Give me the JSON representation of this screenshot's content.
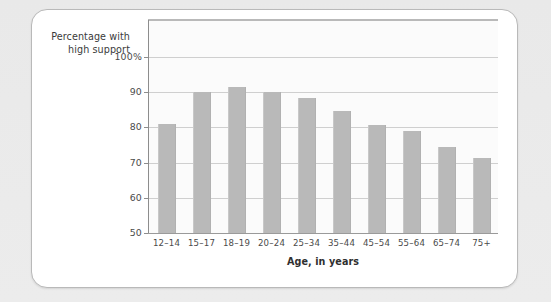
{
  "figure": {
    "card_bg": "#ffffff",
    "page_bg": "#eaeaea",
    "bar_color": "#b9b9b9",
    "grid_color": "#cfcfcf",
    "axis_color": "#8d8d8d"
  },
  "labels": {
    "y_axis_title_line1": "Percentage with",
    "y_axis_title_line2": "high support",
    "x_axis_title": "Age, in years"
  },
  "chart_data": {
    "type": "bar",
    "title": "",
    "subtitle": "",
    "xlabel": "Age, in years",
    "ylabel": "Percentage with high support",
    "categories": [
      "12–14",
      "15–17",
      "18–19",
      "20–24",
      "25–34",
      "35–44",
      "45–54",
      "55–64",
      "65–74",
      "75+"
    ],
    "values": [
      81,
      90,
      91.5,
      90,
      88.3,
      84.8,
      80.7,
      78.9,
      74.3,
      71.2
    ],
    "ylim": [
      50,
      102
    ],
    "yticks": [
      50,
      60,
      70,
      80,
      90,
      100
    ],
    "ytick_labels": [
      "50",
      "60",
      "70",
      "80",
      "90",
      "100%"
    ],
    "grid": true,
    "grid_axis": "y",
    "legend": false,
    "legend_position": "none",
    "series": [
      {
        "name": "Percentage with high support",
        "color": "#b9b9b9",
        "values": [
          81,
          90,
          91.5,
          90,
          88.3,
          84.8,
          80.7,
          78.9,
          74.3,
          71.2
        ]
      }
    ]
  }
}
